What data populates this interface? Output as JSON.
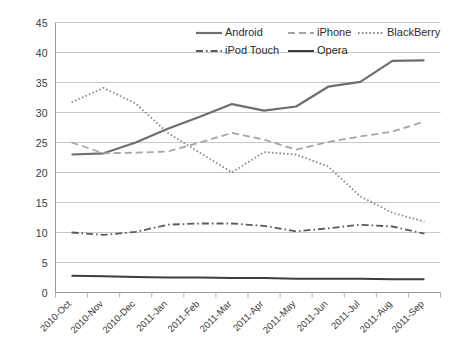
{
  "chart_data": {
    "type": "line",
    "title": "",
    "subtitle": "",
    "xlabel": "",
    "ylabel": "",
    "ylim": [
      0,
      45
    ],
    "ytick_values": [
      0,
      5,
      10,
      15,
      20,
      25,
      30,
      35,
      40,
      45
    ],
    "ytick_labels": [
      "0",
      "5",
      "10",
      "15",
      "20",
      "25",
      "30",
      "35",
      "40",
      "45"
    ],
    "grid": true,
    "legend_position": "top",
    "categories": [
      "2010-Oct",
      "2010-Nov",
      "2010-Dec",
      "2011-Jan",
      "2011-Feb",
      "2011-Mar",
      "2011-Apr",
      "2011-May",
      "2011-Jun",
      "2011-Jul",
      "2011-Aug",
      "2011-Sep"
    ],
    "series": [
      {
        "name": "Android",
        "style": "solid",
        "color": "#6e6e6e",
        "values": [
          23.0,
          23.2,
          25.0,
          27.3,
          29.3,
          31.4,
          30.3,
          31.0,
          34.3,
          35.1,
          38.6,
          38.7
        ]
      },
      {
        "name": "iPhone",
        "style": "dashed",
        "color": "#a5a5a5",
        "values": [
          25.0,
          23.2,
          23.3,
          23.5,
          25.0,
          26.6,
          25.5,
          23.8,
          25.1,
          26.0,
          26.8,
          28.5
        ]
      },
      {
        "name": "BlackBerry",
        "style": "dotted",
        "color": "#8c8c8c",
        "values": [
          31.7,
          34.1,
          31.5,
          26.6,
          23.3,
          20.0,
          23.4,
          23.0,
          21.0,
          16.0,
          13.3,
          11.8
        ]
      },
      {
        "name": "iPod Touch",
        "style": "dashdot",
        "color": "#5a5a5a",
        "values": [
          10.0,
          9.6,
          10.1,
          11.3,
          11.5,
          11.5,
          11.1,
          10.2,
          10.7,
          11.3,
          11.0,
          9.8
        ]
      },
      {
        "name": "Opera",
        "style": "solid-dark",
        "color": "#3d3d3d",
        "values": [
          2.8,
          2.7,
          2.6,
          2.5,
          2.5,
          2.4,
          2.4,
          2.3,
          2.3,
          2.3,
          2.2,
          2.2
        ]
      }
    ]
  },
  "legend": {
    "items": [
      {
        "label": "Android"
      },
      {
        "label": "iPhone"
      },
      {
        "label": "BlackBerry"
      },
      {
        "label": "iPod Touch"
      },
      {
        "label": "Opera"
      }
    ]
  }
}
